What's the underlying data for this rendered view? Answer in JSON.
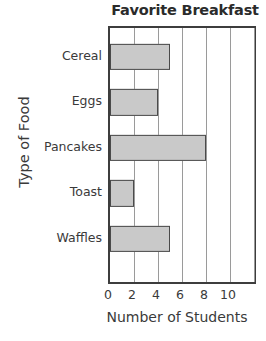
{
  "chart_data": {
    "type": "bar",
    "orientation": "horizontal",
    "title": "Favorite Breakfast",
    "xlabel": "Number of Students",
    "ylabel": "Type of Food",
    "categories": [
      "Cereal",
      "Eggs",
      "Pancakes",
      "Toast",
      "Waffles"
    ],
    "values": [
      5,
      4,
      8,
      2,
      5
    ],
    "xticks": [
      "0",
      "2",
      "4",
      "6",
      "8",
      "10"
    ],
    "xtick_values": [
      0,
      2,
      4,
      6,
      8,
      10
    ],
    "xlim": [
      0,
      12
    ],
    "grid": "vertical",
    "legend": "none",
    "bar_fill_color": "#c9c9c9",
    "bar_border_color": "#4a4a4a",
    "gridline_color": "#9a9a9a",
    "axis_color": "#3d3d3d",
    "background_color": "#ffffff",
    "text_color": "#3a3a3a"
  }
}
